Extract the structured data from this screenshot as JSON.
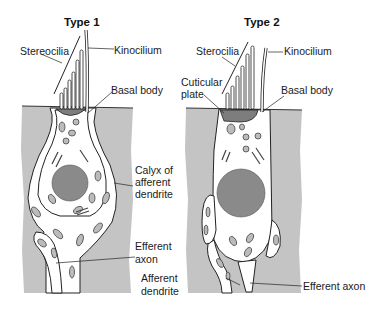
{
  "panels": [
    {
      "title": "Type 1",
      "labels": {
        "stereocilia": "Stereocilia",
        "kinocilium": "Kinocilium",
        "basal_body": "Basal body",
        "calyx_line1": "Calyx of",
        "calyx_line2": "afferent",
        "calyx_line3": "dendrite",
        "efferent_line1": "Efferent",
        "efferent_line2": "axon"
      }
    },
    {
      "title": "Type 2",
      "labels": {
        "stereocilia": "Sterocilia",
        "kinocilium": "Kinocilium",
        "cuticular_line1": "Cuticular",
        "cuticular_line2": "plate",
        "basal_body": "Basal body",
        "afferent_line1": "Afferent",
        "afferent_line2": "dendrite",
        "efferent": "Efferent axon"
      }
    }
  ],
  "colors": {
    "tissue_gray": "#c4c4c4",
    "cell_white": "#ffffff",
    "nucleus_gray": "#8a8a8a",
    "plate_gray": "#7d7d7d",
    "outline": "#222222"
  }
}
